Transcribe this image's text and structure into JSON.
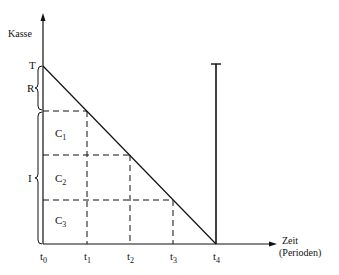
{
  "diagram": {
    "y_axis_label": "Kasse",
    "x_axis_label_line1": "Zeit",
    "x_axis_label_line2": "(Perioden)",
    "y_marks": {
      "top": "T",
      "reserve": "R",
      "investment": "I"
    },
    "areas": [
      {
        "base": "C",
        "sub": "1"
      },
      {
        "base": "C",
        "sub": "2"
      },
      {
        "base": "C",
        "sub": "3"
      }
    ],
    "x_ticks": [
      {
        "base": "t",
        "sub": "0"
      },
      {
        "base": "t",
        "sub": "1"
      },
      {
        "base": "t",
        "sub": "2"
      },
      {
        "base": "t",
        "sub": "3"
      },
      {
        "base": "t",
        "sub": "4"
      }
    ],
    "line_color": "#111111"
  }
}
